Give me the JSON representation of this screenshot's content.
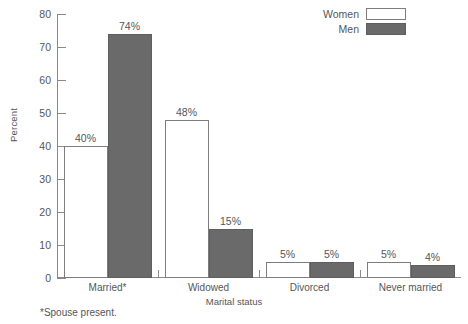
{
  "chart_data": {
    "type": "bar",
    "title": "",
    "xlabel": "Marital status",
    "ylabel": "Percent",
    "ylim": [
      0,
      80
    ],
    "yticks": [
      0,
      10,
      20,
      30,
      40,
      50,
      60,
      70,
      80
    ],
    "grid": false,
    "legend_position": "top-right",
    "categories": [
      "Married*",
      "Widowed",
      "Divorced",
      "Never married"
    ],
    "series": [
      {
        "name": "Women",
        "color": "#ffffff",
        "values": [
          40,
          48,
          5,
          5
        ],
        "labels": [
          "40%",
          "48%",
          "5%",
          "5%"
        ]
      },
      {
        "name": "Men",
        "color": "#6a6a6a",
        "values": [
          74,
          15,
          5,
          4
        ],
        "labels": [
          "74%",
          "15%",
          "5%",
          "4%"
        ]
      }
    ],
    "annotations": [
      "*Spouse present."
    ]
  },
  "legend": {
    "items": [
      {
        "label": "Women",
        "swatch": "women"
      },
      {
        "label": "Men",
        "swatch": "men"
      }
    ]
  },
  "footnote": "*Spouse present.",
  "colors": {
    "men_fill": "#6a6a6a",
    "women_fill": "#ffffff",
    "axis": "#8a8a8a",
    "text": "#55555a"
  }
}
